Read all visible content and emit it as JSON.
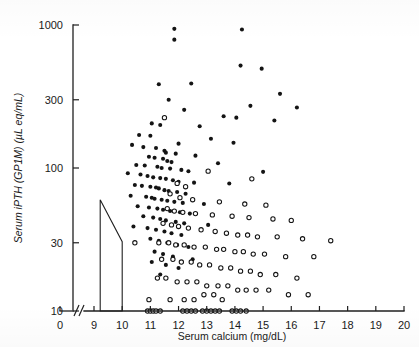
{
  "chart_data": {
    "type": "scatter",
    "title": "",
    "xlabel": "Serum calcium (mg/dL)",
    "ylabel": "Serum iPTH (GP1M) (µL eq/mL)",
    "yscale": "log",
    "xlim": [
      8.6,
      20
    ],
    "ylim": [
      10,
      1000
    ],
    "grid": false,
    "legend_position": "none",
    "x_axis_break": {
      "label": "//",
      "between": [
        0,
        9
      ]
    },
    "x_origin_tick": "0",
    "xticks": [
      9,
      10,
      11,
      12,
      13,
      14,
      15,
      16,
      17,
      18,
      19,
      20
    ],
    "xtick_labels": [
      "9",
      "10",
      "11",
      "12",
      "13",
      "14",
      "15",
      "16",
      "17",
      "18",
      "19",
      "20"
    ],
    "yticks": [
      10,
      30,
      100,
      300,
      1000
    ],
    "ytick_labels": [
      "10",
      "30",
      "100",
      "300",
      "1000"
    ],
    "normal_range_polygon": {
      "name": "normal-range-region",
      "points": [
        [
          9.22,
          60
        ],
        [
          10.0,
          30.5
        ],
        [
          10.0,
          10
        ],
        [
          9.22,
          10
        ],
        [
          9.22,
          60
        ]
      ]
    },
    "series": [
      {
        "name": "Primary hyperparathyroidism",
        "marker": "filled-circle",
        "color": "#141414",
        "points": [
          [
            11.85,
            940
          ],
          [
            11.85,
            790
          ],
          [
            14.25,
            930
          ],
          [
            14.2,
            520
          ],
          [
            14.95,
            495
          ],
          [
            11.3,
            385
          ],
          [
            12.45,
            390
          ],
          [
            15.6,
            330
          ],
          [
            11.65,
            300
          ],
          [
            14.55,
            272
          ],
          [
            16.2,
            265
          ],
          [
            12.2,
            255
          ],
          [
            13.6,
            230
          ],
          [
            14.05,
            225
          ],
          [
            15.4,
            215
          ],
          [
            11.05,
            205
          ],
          [
            11.35,
            200
          ],
          [
            12.75,
            196
          ],
          [
            10.6,
            170
          ],
          [
            11.0,
            168
          ],
          [
            13.15,
            160
          ],
          [
            13.95,
            150
          ],
          [
            12.0,
            148
          ],
          [
            10.35,
            145
          ],
          [
            10.75,
            140
          ],
          [
            11.2,
            138
          ],
          [
            11.5,
            132
          ],
          [
            11.55,
            128
          ],
          [
            11.9,
            126
          ],
          [
            12.6,
            122
          ],
          [
            10.95,
            120
          ],
          [
            11.15,
            118
          ],
          [
            11.45,
            116
          ],
          [
            11.6,
            112
          ],
          [
            11.75,
            110
          ],
          [
            13.4,
            108
          ],
          [
            10.5,
            105
          ],
          [
            10.8,
            104
          ],
          [
            11.25,
            102
          ],
          [
            11.4,
            100
          ],
          [
            11.7,
            99
          ],
          [
            12.1,
            97
          ],
          [
            12.35,
            95
          ],
          [
            15.0,
            94
          ],
          [
            10.2,
            92
          ],
          [
            10.65,
            90
          ],
          [
            10.9,
            88
          ],
          [
            11.1,
            86
          ],
          [
            11.35,
            85
          ],
          [
            11.55,
            84
          ],
          [
            11.8,
            82
          ],
          [
            12.0,
            80
          ],
          [
            12.55,
            79
          ],
          [
            13.8,
            78
          ],
          [
            10.45,
            76
          ],
          [
            10.7,
            75
          ],
          [
            11.0,
            74
          ],
          [
            11.2,
            73
          ],
          [
            11.3,
            72
          ],
          [
            11.5,
            70
          ],
          [
            11.65,
            69
          ],
          [
            11.95,
            68
          ],
          [
            12.25,
            66
          ],
          [
            10.3,
            64
          ],
          [
            10.85,
            63
          ],
          [
            11.05,
            62
          ],
          [
            11.15,
            61
          ],
          [
            11.4,
            60
          ],
          [
            11.6,
            59
          ],
          [
            11.85,
            58
          ],
          [
            12.15,
            57
          ],
          [
            12.9,
            56
          ],
          [
            10.55,
            54
          ],
          [
            10.95,
            53
          ],
          [
            11.25,
            52
          ],
          [
            11.45,
            51
          ],
          [
            11.7,
            50
          ],
          [
            12.05,
            49
          ],
          [
            12.4,
            48
          ],
          [
            10.75,
            46
          ],
          [
            11.1,
            45
          ],
          [
            11.35,
            44
          ],
          [
            11.55,
            43
          ],
          [
            11.9,
            42
          ],
          [
            12.2,
            41
          ],
          [
            13.05,
            40
          ],
          [
            10.4,
            39
          ],
          [
            10.9,
            38
          ],
          [
            11.2,
            37
          ],
          [
            11.5,
            36
          ],
          [
            11.75,
            35
          ],
          [
            12.1,
            34
          ],
          [
            11.0,
            32
          ],
          [
            11.3,
            31
          ],
          [
            11.6,
            30
          ],
          [
            11.95,
            29
          ],
          [
            12.35,
            28
          ],
          [
            11.15,
            26
          ],
          [
            11.45,
            25
          ],
          [
            11.8,
            24
          ],
          [
            12.5,
            23
          ],
          [
            11.05,
            22
          ],
          [
            11.55,
            21
          ],
          [
            12.0,
            20
          ],
          [
            11.35,
            18
          ]
        ]
      },
      {
        "name": "Hypercalcemia of malignancy",
        "marker": "open-circle",
        "color": "#ffffff",
        "points": [
          [
            11.5,
            225
          ],
          [
            13.05,
            95
          ],
          [
            14.6,
            84
          ],
          [
            11.95,
            78
          ],
          [
            12.25,
            74
          ],
          [
            11.7,
            66
          ],
          [
            12.05,
            62
          ],
          [
            12.5,
            60
          ],
          [
            13.45,
            58
          ],
          [
            14.35,
            56
          ],
          [
            15.1,
            55
          ],
          [
            11.6,
            52
          ],
          [
            11.85,
            50
          ],
          [
            12.15,
            49
          ],
          [
            12.6,
            48
          ],
          [
            13.2,
            47
          ],
          [
            13.9,
            46
          ],
          [
            14.5,
            45
          ],
          [
            15.35,
            44
          ],
          [
            16.0,
            43
          ],
          [
            11.45,
            41
          ],
          [
            11.75,
            40
          ],
          [
            12.0,
            39
          ],
          [
            12.35,
            38
          ],
          [
            12.8,
            37
          ],
          [
            13.3,
            36
          ],
          [
            13.7,
            35
          ],
          [
            14.1,
            34
          ],
          [
            14.45,
            34
          ],
          [
            14.8,
            33
          ],
          [
            15.5,
            33
          ],
          [
            16.4,
            32
          ],
          [
            17.4,
            31
          ],
          [
            11.3,
            30
          ],
          [
            11.65,
            30
          ],
          [
            11.9,
            29
          ],
          [
            12.2,
            29
          ],
          [
            12.55,
            28
          ],
          [
            12.95,
            28
          ],
          [
            13.35,
            27
          ],
          [
            13.6,
            27
          ],
          [
            14.0,
            26
          ],
          [
            14.3,
            26
          ],
          [
            14.65,
            25
          ],
          [
            15.05,
            25
          ],
          [
            15.8,
            24
          ],
          [
            16.8,
            24
          ],
          [
            11.4,
            23
          ],
          [
            11.8,
            23
          ],
          [
            12.1,
            22
          ],
          [
            12.45,
            22
          ],
          [
            12.75,
            21
          ],
          [
            13.1,
            21
          ],
          [
            13.5,
            20
          ],
          [
            13.85,
            20
          ],
          [
            14.2,
            19
          ],
          [
            14.55,
            19
          ],
          [
            14.9,
            18
          ],
          [
            15.45,
            18
          ],
          [
            16.2,
            17
          ],
          [
            11.25,
            17
          ],
          [
            11.55,
            17
          ],
          [
            11.95,
            16
          ],
          [
            12.3,
            16
          ],
          [
            12.65,
            16
          ],
          [
            13.0,
            15
          ],
          [
            13.4,
            15
          ],
          [
            13.75,
            15
          ],
          [
            14.1,
            14
          ],
          [
            14.4,
            14
          ],
          [
            14.75,
            14
          ],
          [
            15.2,
            14
          ],
          [
            15.9,
            13
          ],
          [
            16.6,
            13
          ],
          [
            12.9,
            13
          ],
          [
            13.25,
            13
          ],
          [
            13.55,
            12
          ],
          [
            12.2,
            12
          ],
          [
            12.55,
            12
          ],
          [
            11.7,
            12
          ],
          [
            10.45,
            30
          ],
          [
            10.95,
            12
          ],
          [
            10.9,
            10
          ],
          [
            11.0,
            10
          ],
          [
            11.1,
            10
          ],
          [
            11.2,
            10
          ],
          [
            11.35,
            10
          ],
          [
            12.15,
            10
          ],
          [
            12.3,
            10
          ],
          [
            12.45,
            10
          ],
          [
            12.6,
            10
          ],
          [
            12.85,
            10
          ],
          [
            13.0,
            10
          ],
          [
            13.15,
            10
          ],
          [
            13.3,
            10
          ],
          [
            13.45,
            10
          ],
          [
            13.9,
            10
          ],
          [
            14.05,
            10
          ],
          [
            14.2,
            10
          ],
          [
            14.4,
            10
          ]
        ]
      }
    ]
  }
}
